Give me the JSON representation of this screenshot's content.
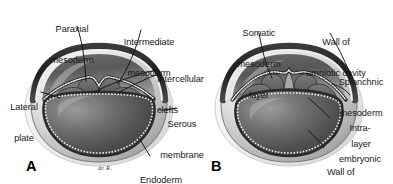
{
  "figure": {
    "background_color": "#ffffff",
    "width": 393,
    "height": 184
  },
  "palette": {
    "ink": "#171717",
    "leader_line": "#1a1a1a",
    "outer_shell_light": "#f2f2f2",
    "outer_shell_mid": "#c9c9c9",
    "outer_shell_dark": "#6e6e6e",
    "rim_dark": "#2e2e2e",
    "cavity_dark": "#4a4a4a",
    "cavity_mid": "#7d7d7d",
    "yolk_dark": "#3f3f3f",
    "yolk_mid": "#8a8a8a",
    "yolk_light": "#d6d6d6",
    "mesoderm_fill": "#6a6a6a",
    "epithelium": "#e8e8e8",
    "epithelium_edge": "#2b2b2b"
  },
  "panels": [
    {
      "letter": "A",
      "labels": [
        {
          "name": "paraxial-mesoderm",
          "lines": [
            "Paraxial",
            "mesoderm"
          ],
          "align": "center"
        },
        {
          "name": "intermediate-mesoderm",
          "lines": [
            "Intermediate",
            "mesoderm"
          ],
          "align": "center"
        },
        {
          "name": "intercellular-clefts",
          "lines": [
            "Intercellular",
            "clefts"
          ],
          "align": "left"
        },
        {
          "name": "lateral-plate",
          "lines": [
            "Lateral",
            "plate"
          ],
          "align": "center"
        },
        {
          "name": "serous-membrane",
          "lines": [
            "Serous",
            "membrane"
          ],
          "align": "center"
        },
        {
          "name": "endoderm",
          "lines": [
            "Endoderm"
          ],
          "align": "left"
        }
      ]
    },
    {
      "letter": "B",
      "labels": [
        {
          "name": "somatic-mesoderm-layer",
          "lines": [
            "Somatic",
            "mesoderm",
            "layer"
          ],
          "align": "center"
        },
        {
          "name": "wall-of-amniotic-cavity",
          "lines": [
            "Wall of",
            "amniotic cavity"
          ],
          "align": "center"
        },
        {
          "name": "splanchnic-mesoderm-layer",
          "lines": [
            "Splanchnic",
            "mesoderm",
            "layer"
          ],
          "align": "center"
        },
        {
          "name": "intraembryonic-cavity",
          "lines": [
            "Intra-",
            "embryonic",
            "cavity"
          ],
          "align": "center"
        },
        {
          "name": "wall-of-yolk-sac",
          "lines": [
            "Wall of",
            "yolk sac"
          ],
          "align": "left"
        }
      ]
    }
  ],
  "text": {
    "paraxial_l1": "Paraxial",
    "paraxial_l2": "mesoderm",
    "intermediate_l1": "Intermediate",
    "intermediate_l2": "mesoderm",
    "clefts_l1": "Intercellular",
    "clefts_l2": "clefts",
    "lateral_l1": "Lateral",
    "lateral_l2": "plate",
    "serous_l1": "Serous",
    "serous_l2": "membrane",
    "endoderm": "Endoderm",
    "somatic_l1": "Somatic",
    "somatic_l2": "mesoderm",
    "somatic_l3": "layer",
    "amnion_l1": "Wall of",
    "amnion_l2": "amniotic cavity",
    "splanchnic_l1": "Splanchnic",
    "splanchnic_l2": "mesoderm",
    "splanchnic_l3": "layer",
    "intraembryonic_l1": "Intra-",
    "intraembryonic_l2": "embryonic",
    "intraembryonic_l3": "cavity",
    "yolksac_l1": "Wall of",
    "yolksac_l2": "yolk sac",
    "letter_a": "A",
    "letter_b": "B",
    "signature": "de R."
  }
}
